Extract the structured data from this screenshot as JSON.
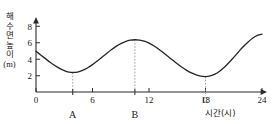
{
  "chart_data": {
    "type": "line",
    "title": "",
    "subtitle": "",
    "xlabel": "시간(시)",
    "ylabel": "해수면 높이 (m)",
    "ylabel_chars": [
      "해",
      "수",
      "면",
      "높",
      "이"
    ],
    "ylabel_unit": "(m)",
    "xlim": [
      0,
      24
    ],
    "ylim": [
      0,
      8.6
    ],
    "xticks": [
      0,
      6,
      12,
      18,
      24
    ],
    "xtick_labels": [
      "0",
      "6",
      "12",
      "18",
      "24"
    ],
    "yticks": [
      2,
      4,
      6,
      8
    ],
    "ytick_labels": [
      "2",
      "4",
      "6",
      "8"
    ],
    "grid": false,
    "legend": false,
    "series": [
      {
        "name": "해수면 높이",
        "color": "#262626",
        "x": [
          0,
          0.5,
          1,
          1.5,
          2,
          2.5,
          3,
          3.5,
          4,
          4.5,
          5,
          5.5,
          6,
          6.5,
          7,
          7.5,
          8,
          8.5,
          9,
          9.5,
          10,
          10.5,
          11,
          11.5,
          12,
          12.5,
          13,
          13.5,
          14,
          14.5,
          15,
          15.5,
          16,
          16.5,
          17,
          17.5,
          18,
          18.5,
          19,
          19.5,
          20,
          20.5,
          21,
          21.5,
          22,
          22.5,
          23,
          23.5,
          24
        ],
        "y": [
          5.0,
          4.55,
          4.1,
          3.65,
          3.25,
          2.9,
          2.62,
          2.44,
          2.4,
          2.48,
          2.68,
          2.98,
          3.36,
          3.8,
          4.27,
          4.74,
          5.2,
          5.6,
          5.95,
          6.2,
          6.36,
          6.42,
          6.38,
          6.24,
          6.0,
          5.68,
          5.28,
          4.84,
          4.38,
          3.92,
          3.46,
          3.04,
          2.66,
          2.34,
          2.1,
          1.95,
          1.9,
          1.98,
          2.2,
          2.56,
          3.04,
          3.62,
          4.26,
          4.92,
          5.56,
          6.12,
          6.6,
          6.95,
          7.1
        ],
        "note": "approximately two tidal cycles; sampled from the plotted curve"
      }
    ],
    "annotations": [
      {
        "id": "A",
        "label": "A",
        "x": 3.9,
        "y": 2.4,
        "kind": "low-tide",
        "guide": true,
        "label_position": "below-axis"
      },
      {
        "id": "B",
        "label": "B",
        "x": 10.5,
        "y": 6.42,
        "kind": "high-tide",
        "guide": true,
        "label_position": "below-axis"
      },
      {
        "id": "C",
        "label": "C",
        "x": 18.0,
        "y": 1.9,
        "kind": "low-tide",
        "guide": true,
        "label_position": "on-axis"
      }
    ],
    "curve_endpoints": {
      "start_y": 5.0,
      "end_y": 7.1
    }
  },
  "header": {
    "clipped_text": ""
  }
}
